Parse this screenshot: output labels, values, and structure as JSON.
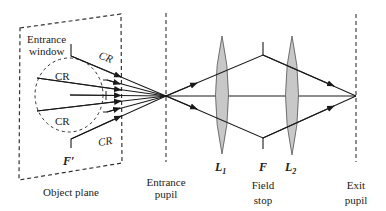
{
  "diagram": {
    "labels": {
      "entrance_window": [
        "Entrance",
        "window"
      ],
      "cr": "CR",
      "f_prime": "F′",
      "object_plane": "Object plane",
      "entrance_pupil": [
        "Entrance",
        "pupil"
      ],
      "l1": "L",
      "l1_sub": "1",
      "f": "F",
      "l2": "L",
      "l2_sub": "2",
      "field_stop": [
        "Field",
        "stop"
      ],
      "exit_pupil": [
        "Exit",
        "pupil"
      ]
    },
    "colors": {
      "line": "#1a1a1a",
      "lens_fill": "#c8c8c8",
      "dash": "#444444"
    }
  }
}
